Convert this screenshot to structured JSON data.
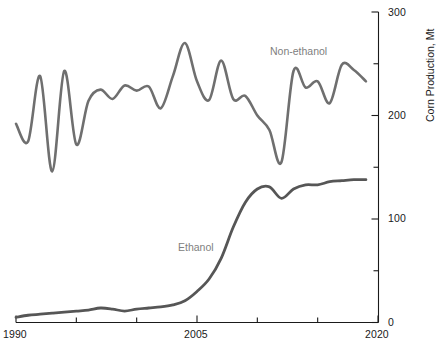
{
  "chart_data": {
    "type": "line",
    "title": "",
    "xlabel": "",
    "ylabel": "Corn Production, Mt",
    "xlim": [
      1990,
      2020
    ],
    "ylim": [
      0,
      300
    ],
    "grid": false,
    "legend_position": "inline-annotation",
    "x_ticks_major": [
      1990,
      2005,
      2020
    ],
    "x_ticks_major_labels": [
      "1990",
      "2005",
      "2020"
    ],
    "x_ticks_minor": [
      1995,
      2000,
      2010,
      2015
    ],
    "y_ticks_major": [
      0,
      100,
      200,
      300
    ],
    "y_ticks_major_labels": [
      "0",
      "100",
      "200",
      "300"
    ],
    "y_ticks_minor": [
      50,
      150,
      250
    ],
    "y_axis_side": "right",
    "series": [
      {
        "name": "Non-ethanol",
        "color": "#6f6f6f",
        "label_text": "Non-ethanol",
        "x": [
          1990,
          1991,
          1992,
          1993,
          1994,
          1995,
          1996,
          1997,
          1998,
          1999,
          2000,
          2001,
          2002,
          2003,
          2004,
          2005,
          2006,
          2007,
          2008,
          2009,
          2010,
          2011,
          2012,
          2013,
          2014,
          2015,
          2016,
          2017,
          2018,
          2019
        ],
        "values": [
          192,
          175,
          238,
          146,
          243,
          172,
          214,
          225,
          216,
          229,
          224,
          228,
          207,
          238,
          270,
          233,
          215,
          253,
          216,
          219,
          200,
          186,
          155,
          243,
          227,
          233,
          212,
          249,
          244,
          233
        ]
      },
      {
        "name": "Ethanol",
        "color": "#565656",
        "label_text": "Ethanol",
        "x": [
          1990,
          1991,
          1992,
          1993,
          1994,
          1995,
          1996,
          1997,
          1998,
          1999,
          2000,
          2001,
          2002,
          2003,
          2004,
          2005,
          2006,
          2007,
          2008,
          2009,
          2010,
          2011,
          2012,
          2013,
          2014,
          2015,
          2016,
          2017,
          2018,
          2019
        ],
        "values": [
          5,
          7,
          8,
          9,
          10,
          11,
          12,
          14,
          13,
          11,
          13,
          14,
          15,
          17,
          21,
          30,
          42,
          62,
          92,
          116,
          129,
          131,
          120,
          129,
          133,
          133,
          136,
          137,
          138,
          138
        ]
      }
    ],
    "annotations": [
      {
        "text": "Non-ethanol",
        "x": 2013.0,
        "y": 264,
        "color": "#808080"
      },
      {
        "text": "Ethanol",
        "x": 2003.5,
        "y": 78,
        "color": "#808080"
      }
    ]
  },
  "axes": {
    "x_label_left": "1990",
    "x_label_mid": "2005",
    "x_label_right": "2020",
    "y_label_0": "0",
    "y_label_100": "100",
    "y_label_200": "200",
    "y_label_300": "300",
    "y_title": "Corn Production, Mt"
  },
  "colors": {
    "axis": "#1a1a1a",
    "non_ethanol_line": "#6f6f6f",
    "ethanol_line": "#565656",
    "annotation_text": "#808080",
    "background": "#ffffff"
  }
}
